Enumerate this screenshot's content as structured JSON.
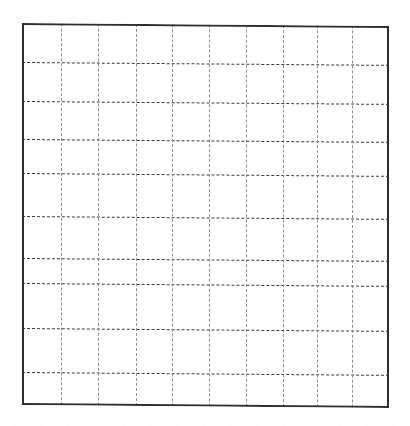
{
  "figure": {
    "kind": "blank-grid-chart",
    "title": "",
    "subtitle": "",
    "caption": "",
    "background_color": "#fefefe",
    "page_width": 410,
    "page_height": 426
  },
  "plot_area": {
    "left": 22,
    "top": 23,
    "right": 389,
    "bottom": 405,
    "width": 367,
    "height": 382,
    "border_color": "#2e2e2e",
    "border_width_px": 2,
    "fill_color": "#ffffff",
    "skew_deg": 0.45
  },
  "grid": {
    "horizontal": {
      "count": 9,
      "color": "#3a3a3a",
      "style": "dashed",
      "width_px": 1.6,
      "dash_length_px": 3,
      "dash_gap_px": 2,
      "positions_y": [
        61.7,
        100.7,
        139.3,
        173.3,
        216.0,
        258.3,
        283.3,
        327.7,
        372.3
      ]
    },
    "vertical": {
      "count": 9,
      "color": "#8e8e8e",
      "style": "dashed",
      "width_px": 1,
      "dash_length_px": 3,
      "dash_gap_px": 3,
      "positions_x": [
        60.7,
        98.3,
        136.0,
        172.0,
        209.0,
        246.0,
        283.0,
        317.3,
        351.7
      ]
    }
  },
  "chart_data": {
    "type": "line",
    "title": "",
    "subtitle": "",
    "xlabel": "",
    "ylabel": "",
    "series": [],
    "categories": [],
    "x": [],
    "values": [],
    "annotations": [],
    "legend": {
      "entries": [],
      "position": "none",
      "visible": false
    },
    "axes": {
      "x": {
        "visible_ticks": false,
        "tick_labels": [],
        "major_gridlines": 9,
        "range_shown": false,
        "xlim": null
      },
      "y": {
        "visible_ticks": false,
        "tick_labels": [],
        "major_gridlines": 9,
        "range_shown": false,
        "ylim": null
      }
    },
    "grid": true,
    "grid_rows": 10,
    "grid_cols": 10,
    "data_points_present": false,
    "note": "Empty plotting grid: frame with dashed gridlines and no plotted data, tick labels, axis titles or legend."
  }
}
